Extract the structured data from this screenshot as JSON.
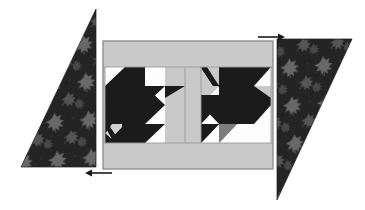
{
  "figure": {
    "background_color": "#ffffff"
  },
  "palette": {
    "background": "#ffffff",
    "sashing_light_gray": "#c9c9c9",
    "border_light_gray": "#c9c9c9",
    "patch_white": "#fdfdfd",
    "patch_dark": "#1b1b1b",
    "patch_mid_gray": "#7d7d7d",
    "panel_outline": "#8a8a8a",
    "seam_line": "#9a9a9a",
    "floral_base": "#262626",
    "floral_motif": "#6e6e6e",
    "arrow_color": "#1b1b1b"
  },
  "center_panel": {
    "name": "center pieced panel",
    "outline_color": "#8a8a8a",
    "x": 103,
    "y": 41,
    "width": 170,
    "height": 128,
    "top_border": {
      "label": "top border strip",
      "height": 26,
      "color": "#c9c9c9"
    },
    "bottom_border": {
      "label": "bottom border strip",
      "height": 26,
      "color": "#c9c9c9"
    },
    "sashing": {
      "label": "center vertical sashing",
      "width": 16,
      "color": "#c9c9c9"
    },
    "blocks": [
      {
        "label": "left pieced block",
        "position": "left",
        "grid": "4x4 half-square triangle units"
      },
      {
        "label": "right pieced block",
        "position": "right",
        "grid": "4x4 half-square triangle units"
      }
    ]
  },
  "setting_triangles": [
    {
      "label": "left setting triangle",
      "position": "left",
      "fabric": "dark floral print",
      "base_color": "#262626",
      "motif_color": "#6e6e6e",
      "orientation": "right angle at bottom-left, hypotenuse from top-right down to bottom-left"
    },
    {
      "label": "right setting triangle",
      "position": "right",
      "fabric": "dark floral print",
      "base_color": "#262626",
      "motif_color": "#6e6e6e",
      "orientation": "right angle at top-right, hypotenuse from top-left down to bottom"
    }
  ],
  "arrows": [
    {
      "label": "top right direction arrow",
      "name": "arrow-right",
      "direction": "right",
      "x": 262,
      "y": 36,
      "length": 22,
      "color": "#1b1b1b"
    },
    {
      "label": "bottom left direction arrow",
      "name": "arrow-left",
      "direction": "left",
      "x": 85,
      "y": 172,
      "length": 22,
      "color": "#1b1b1b"
    }
  ]
}
